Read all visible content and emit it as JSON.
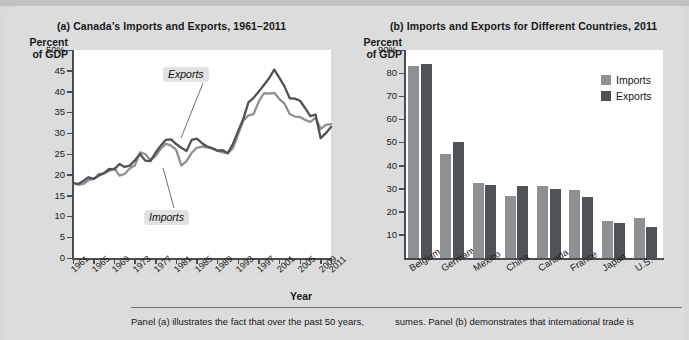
{
  "figure": {
    "panel_a_title": "(a) Canada’s Imports and Exports, 1961–2011",
    "panel_b_title": "(b) Imports and Exports for Different Countries, 2011",
    "y_axis_caption": "Percent\nof GDP",
    "y_axis_caption_line1": "Percent",
    "y_axis_caption_line2": "of GDP",
    "x_axis_label_a": "Year",
    "colors": {
      "imports": "#8e9194",
      "exports": "#4f5357",
      "plot_background": "#ffffff",
      "page_background": "#dcdcdc",
      "axis": "#4a4d50",
      "callout_background": "#e2e2e2"
    }
  },
  "legend": {
    "items": [
      {
        "label": "Imports",
        "color": "#8e9194"
      },
      {
        "label": "Exports",
        "color": "#4f5357"
      }
    ]
  },
  "callouts": {
    "exports": "Exports",
    "imports": "Imports"
  },
  "caption": {
    "left": "Panel (a) illustrates the fact that over the past 50 years,",
    "right": "sumes. Panel (b) demonstrates that international trade is"
  },
  "chart_data": [
    {
      "type": "line",
      "title": "(a) Canada’s Imports and Exports, 1961–2011",
      "xlabel": "Year",
      "ylabel": "Percent of GDP",
      "ylim": [
        0,
        50
      ],
      "yticks": [
        "0",
        "5",
        "10",
        "15",
        "20",
        "25",
        "30",
        "35",
        "40",
        "45",
        "50%"
      ],
      "ytick_values": [
        0,
        5,
        10,
        15,
        20,
        25,
        30,
        35,
        40,
        45,
        50
      ],
      "xlim": [
        1961,
        2011
      ],
      "xticks": [
        "1961",
        "1965",
        "1969",
        "1973",
        "1977",
        "1981",
        "1985",
        "1989",
        "1993",
        "1997",
        "2001",
        "2005",
        "2009",
        "2011"
      ],
      "grid": false,
      "legend_position": "inline-callouts",
      "x": [
        1961,
        1962,
        1963,
        1964,
        1965,
        1966,
        1967,
        1968,
        1969,
        1970,
        1971,
        1972,
        1973,
        1974,
        1975,
        1976,
        1977,
        1978,
        1979,
        1980,
        1981,
        1982,
        1983,
        1984,
        1985,
        1986,
        1987,
        1988,
        1989,
        1990,
        1991,
        1992,
        1993,
        1994,
        1995,
        1996,
        1997,
        1998,
        1999,
        2000,
        2001,
        2002,
        2003,
        2004,
        2005,
        2006,
        2007,
        2008,
        2009,
        2010,
        2011
      ],
      "series": [
        {
          "name": "Exports",
          "color": "#4f5357",
          "values": [
            18.0,
            17.8,
            18.5,
            19.4,
            19.0,
            19.8,
            20.4,
            21.4,
            21.3,
            22.6,
            21.9,
            22.2,
            23.5,
            25.0,
            23.4,
            23.3,
            25.3,
            27.0,
            28.4,
            28.5,
            27.4,
            26.5,
            25.7,
            28.4,
            28.7,
            27.6,
            26.8,
            26.4,
            25.8,
            25.9,
            25.2,
            27.4,
            30.5,
            33.4,
            37.4,
            38.5,
            40.0,
            41.6,
            43.2,
            45.3,
            43.3,
            41.2,
            38.4,
            38.3,
            37.8,
            36.0,
            34.1,
            34.5,
            28.8,
            30.0,
            31.5
          ]
        },
        {
          "name": "Imports",
          "color": "#8e9194",
          "values": [
            18.0,
            17.6,
            17.8,
            18.7,
            19.0,
            20.2,
            20.3,
            20.9,
            21.6,
            19.8,
            20.2,
            21.5,
            22.3,
            25.4,
            25.0,
            23.5,
            24.5,
            26.3,
            27.5,
            27.0,
            26.0,
            22.2,
            23.3,
            25.3,
            26.5,
            26.8,
            26.6,
            26.3,
            25.8,
            25.4,
            25.2,
            26.4,
            29.7,
            33.0,
            34.3,
            34.6,
            37.6,
            39.6,
            39.5,
            39.7,
            38.2,
            37.1,
            34.6,
            34.0,
            33.9,
            33.2,
            32.7,
            33.7,
            31.0,
            32.0,
            32.2
          ]
        }
      ]
    },
    {
      "type": "bar",
      "title": "(b) Imports and Exports for Different Countries, 2011",
      "xlabel": "",
      "ylabel": "Percent of GDP",
      "ylim": [
        0,
        90
      ],
      "yticks": [
        "10",
        "20",
        "30",
        "40",
        "50",
        "60",
        "70",
        "80",
        "90%"
      ],
      "ytick_values": [
        10,
        20,
        30,
        40,
        50,
        60,
        70,
        80,
        90
      ],
      "grid": false,
      "legend_position": "top-right",
      "categories": [
        "Belgium",
        "Germany",
        "Mexico",
        "China",
        "Canada",
        "France",
        "Japan",
        "U.S."
      ],
      "series": [
        {
          "name": "Imports",
          "color": "#8e9194",
          "values": [
            83,
            45,
            32.5,
            27,
            31,
            29.5,
            16,
            17.5
          ]
        },
        {
          "name": "Exports",
          "color": "#4f5357",
          "values": [
            84,
            50,
            31.5,
            31,
            30,
            26.5,
            15,
            13.5
          ]
        }
      ]
    }
  ]
}
